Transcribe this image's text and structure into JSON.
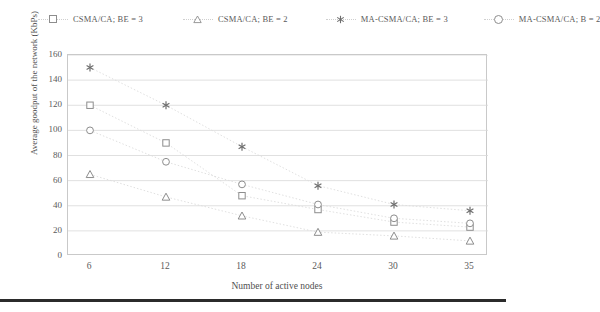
{
  "chart_data": {
    "type": "scatter",
    "title": "",
    "xlabel": "Number of active nodes",
    "ylabel": "Average goodput of the network (KbPs)",
    "categories": [
      "6",
      "12",
      "18",
      "24",
      "30",
      "35"
    ],
    "x": [
      6,
      12,
      18,
      24,
      30,
      35
    ],
    "xtick_labels": [
      "6",
      "12",
      "18",
      "24",
      "30",
      "35"
    ],
    "ytick_labels": [
      "0",
      "20",
      "40",
      "60",
      "80",
      "100",
      "120",
      "140",
      "160"
    ],
    "yticks": [
      0,
      20,
      40,
      60,
      80,
      100,
      120,
      140,
      160
    ],
    "ylim": [
      0,
      160
    ],
    "grid": "horizontal",
    "legend_position": "top",
    "series": [
      {
        "name": "CSMA/CA; BE = 3",
        "marker": "square",
        "color": "#8d8d8d",
        "values": [
          120,
          90,
          48,
          37,
          27,
          23
        ]
      },
      {
        "name": "CSMA/CA; BE = 2",
        "marker": "triangle",
        "color": "#8d8d8d",
        "values": [
          65,
          47,
          32,
          19,
          16,
          12
        ]
      },
      {
        "name": "MA-CSMA/CA; BE = 3",
        "marker": "star",
        "color": "#6e6e6e",
        "values": [
          150,
          120,
          87,
          56,
          41,
          36
        ]
      },
      {
        "name": "MA-CSMA/CA; B = 2",
        "marker": "circle",
        "color": "#8d8d8d",
        "values": [
          100,
          75,
          57,
          41,
          30,
          26
        ]
      }
    ]
  },
  "legend": {
    "entries": [
      {
        "label": "CSMA/CA; BE = 3",
        "marker": "square"
      },
      {
        "label": "CSMA/CA; BE = 2",
        "marker": "triangle"
      },
      {
        "label": "MA-CSMA/CA; BE = 3",
        "marker": "star"
      },
      {
        "label": "MA-CSMA/CA; B = 2",
        "marker": "circle"
      }
    ]
  },
  "colors": {
    "gridline": "#d8d8d8",
    "frame": "#c9c9c9",
    "marker": "#8d8d8d",
    "series_line": "#dcdcdc",
    "text": "#4f4f4f",
    "bottom_rule": "#2b2b2b"
  }
}
